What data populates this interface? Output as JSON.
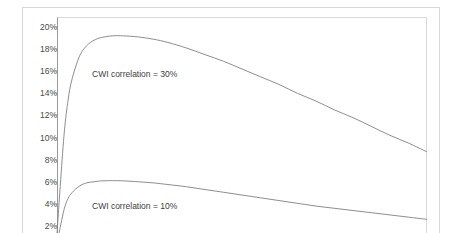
{
  "title_remnant": "",
  "chart_data": {
    "type": "line",
    "title": "",
    "xlabel": "",
    "ylabel": "",
    "ylim": [
      1.2,
      20.8
    ],
    "xlim": [
      0,
      100
    ],
    "grid": false,
    "legend": "inline-annotations",
    "y_ticks": [
      "20%",
      "18%",
      "16%",
      "14%",
      "12%",
      "10%",
      "8%",
      "6%",
      "4%",
      "2%"
    ],
    "y_tick_values": [
      20,
      18,
      16,
      14,
      12,
      10,
      8,
      6,
      4,
      2
    ],
    "note": "Plot is cropped: x-axis, x tick labels and chart title are outside the captured image.",
    "series": [
      {
        "name": "CWI correlation = 30%",
        "label": "CWI correlation = 30%",
        "color": "#808080",
        "peak_value": 19.2,
        "end_value": 8.7,
        "x": [
          0,
          1,
          2,
          3,
          4,
          6,
          8,
          10,
          12,
          15,
          18,
          22,
          26,
          30,
          35,
          40,
          45,
          50,
          55,
          60,
          65,
          70,
          75,
          80,
          85,
          90,
          95,
          100
        ],
        "values": [
          1.3,
          6.2,
          10.6,
          13.4,
          15.2,
          17.3,
          18.3,
          18.8,
          19.05,
          19.2,
          19.2,
          19.1,
          18.9,
          18.6,
          18.1,
          17.5,
          16.9,
          16.2,
          15.5,
          14.8,
          14.0,
          13.3,
          12.5,
          11.8,
          11.0,
          10.2,
          9.5,
          8.7
        ]
      },
      {
        "name": "CWI correlation = 10%",
        "label": "CWI correlation = 10%",
        "color": "#808080",
        "peak_value": 6.1,
        "end_value": 2.6,
        "x": [
          0,
          1,
          2,
          3,
          4,
          6,
          8,
          10,
          12,
          15,
          18,
          22,
          26,
          30,
          35,
          40,
          45,
          50,
          55,
          60,
          65,
          70,
          75,
          80,
          85,
          90,
          95,
          100
        ],
        "values": [
          0.4,
          2.1,
          3.6,
          4.5,
          5.0,
          5.6,
          5.9,
          6.0,
          6.08,
          6.1,
          6.08,
          6.0,
          5.9,
          5.75,
          5.55,
          5.3,
          5.05,
          4.8,
          4.55,
          4.3,
          4.05,
          3.8,
          3.6,
          3.4,
          3.2,
          3.0,
          2.8,
          2.6
        ]
      }
    ],
    "annotations": [
      {
        "text": "CWI correlation = 30%",
        "x_px": 92,
        "y_px": 69
      },
      {
        "text": "CWI correlation = 10%",
        "x_px": 92,
        "y_px": 201
      }
    ]
  }
}
